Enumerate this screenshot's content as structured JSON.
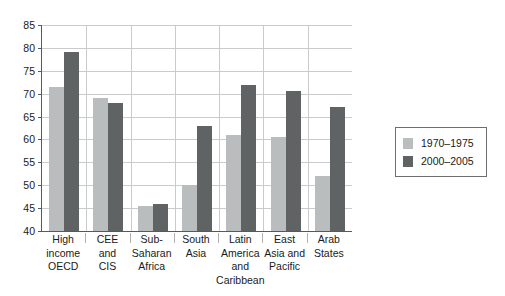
{
  "chart_data": {
    "type": "bar",
    "title": "",
    "subtitle": "",
    "xlabel": "",
    "ylabel": "",
    "ylim": [
      40,
      85
    ],
    "ytick_step": 5,
    "yticks": [
      85,
      80,
      75,
      70,
      65,
      60,
      55,
      50,
      45,
      40
    ],
    "grid": true,
    "legend_position": "right",
    "categories": [
      "High income OECD",
      "CEE and CIS",
      "Sub-Saharan Africa",
      "South Asia",
      "Latin America and Caribbean",
      "East Asia and Pacific",
      "Arab States"
    ],
    "category_label_lines": [
      [
        "High",
        "income",
        "OECD"
      ],
      [
        "CEE",
        "and",
        "CIS"
      ],
      [
        "Sub-",
        "Saharan",
        "Africa"
      ],
      [
        "South",
        "Asia"
      ],
      [
        "Latin",
        "America",
        "and",
        "Caribbean"
      ],
      [
        "East",
        "Asia and",
        "Pacific"
      ],
      [
        "Arab",
        "States"
      ]
    ],
    "series": [
      {
        "name": "1970–1975",
        "color": "#b9bdbd",
        "values": [
          71.5,
          69.0,
          45.5,
          50.0,
          61.0,
          60.5,
          52.0
        ]
      },
      {
        "name": "2000–2005",
        "color": "#5f6364",
        "values": [
          79.0,
          68.0,
          46.0,
          63.0,
          72.0,
          70.5,
          67.0
        ]
      }
    ]
  },
  "legend": {
    "entries": [
      {
        "label": "1970–1975"
      },
      {
        "label": "2000–2005"
      }
    ]
  },
  "colors": {
    "series_1970_1975": "#b9bdbd",
    "series_2000_2005": "#5f6364",
    "axis": "#58595b",
    "gridline": "#c9cbcd",
    "background": "#ffffff"
  }
}
